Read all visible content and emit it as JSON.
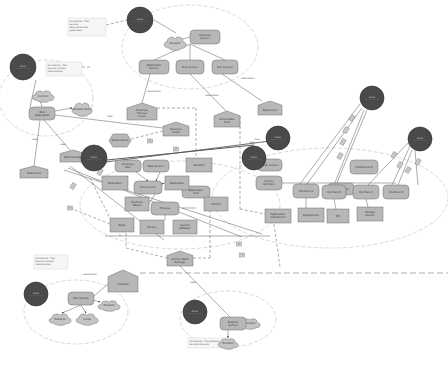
{
  "diagram": {
    "type": "concept-map",
    "colors": {
      "actor": "#4a4a4a",
      "node_fill": "#b7b7b7",
      "node_stroke": "#6f6f6f",
      "cloud_fill": "#c4c4c4",
      "group_ellipse": "#c8c8c8",
      "edge": "#555555",
      "background": "#ffffff"
    },
    "actors": [
      {
        "id": "a1",
        "label": "Actor",
        "x": 140,
        "y": 20,
        "r": 13
      },
      {
        "id": "a2",
        "label": "Actor",
        "x": 23,
        "y": 67,
        "r": 13
      },
      {
        "id": "a3",
        "label": "Actor",
        "x": 94,
        "y": 158,
        "r": 13
      },
      {
        "id": "a4",
        "label": "Actor",
        "x": 278,
        "y": 138,
        "r": 12
      },
      {
        "id": "a5",
        "label": "Actor",
        "x": 254,
        "y": 158,
        "r": 12
      },
      {
        "id": "a6",
        "label": "Actor",
        "x": 372,
        "y": 98,
        "r": 12
      },
      {
        "id": "a7",
        "label": "Actor",
        "x": 420,
        "y": 139,
        "r": 12
      },
      {
        "id": "a8",
        "label": "Actor",
        "x": 36,
        "y": 294,
        "r": 12
      },
      {
        "id": "a9",
        "label": "Actor",
        "x": 195,
        "y": 312,
        "r": 12
      }
    ],
    "groups": [
      {
        "id": "g1",
        "cx": 190,
        "cy": 47,
        "rx": 68,
        "ry": 42
      },
      {
        "id": "g2",
        "cx": 46,
        "cy": 98,
        "rx": 47,
        "ry": 38
      },
      {
        "id": "g3",
        "cx": 180,
        "cy": 205,
        "rx": 100,
        "ry": 44
      },
      {
        "id": "g4",
        "cx": 330,
        "cy": 198,
        "rx": 118,
        "ry": 50
      },
      {
        "id": "g5",
        "cx": 76,
        "cy": 312,
        "rx": 52,
        "ry": 32
      },
      {
        "id": "g6",
        "cx": 228,
        "cy": 319,
        "rx": 48,
        "ry": 28
      }
    ],
    "notes": [
      {
        "id": "n1",
        "x": 68,
        "y": 18,
        "w": 38,
        "h": 18,
        "lines": [
          "Annotation: The",
          "service",
          "description text",
          "goes here..."
        ]
      },
      {
        "id": "n2",
        "x": 46,
        "y": 62,
        "w": 36,
        "h": 14,
        "lines": [
          "Annotation: The",
          "service context",
          "relationships"
        ]
      },
      {
        "id": "n3",
        "x": 34,
        "y": 255,
        "w": 34,
        "h": 14,
        "lines": [
          "Annotation: The",
          "service content",
          "relationships"
        ]
      },
      {
        "id": "n4",
        "x": 188,
        "y": 338,
        "w": 40,
        "h": 10,
        "lines": [
          "Annotation: The software",
          "service lifecycle"
        ]
      }
    ],
    "rounded_nodes": [
      {
        "id": "r1",
        "label": "Business Service",
        "x": 190,
        "y": 30,
        "w": 30,
        "h": 14
      },
      {
        "id": "r2",
        "label": "Application Service",
        "x": 139,
        "y": 60,
        "w": 30,
        "h": 14
      },
      {
        "id": "r3",
        "label": "Tech Service",
        "x": 176,
        "y": 60,
        "w": 28,
        "h": 14
      },
      {
        "id": "r4",
        "label": "Ext. Service",
        "x": 212,
        "y": 60,
        "w": 26,
        "h": 14
      },
      {
        "id": "r5",
        "label": "Web Application",
        "x": 29,
        "y": 107,
        "w": 26,
        "h": 13
      },
      {
        "id": "r6",
        "label": "Business Role",
        "x": 115,
        "y": 160,
        "w": 26,
        "h": 12
      },
      {
        "id": "r7",
        "label": "Data Service",
        "x": 143,
        "y": 160,
        "w": 26,
        "h": 12
      },
      {
        "id": "r8",
        "label": "Core Service",
        "x": 134,
        "y": 181,
        "w": 28,
        "h": 13
      },
      {
        "id": "r9",
        "label": "Process",
        "x": 151,
        "y": 202,
        "w": 28,
        "h": 13
      },
      {
        "id": "r10",
        "label": "Component",
        "x": 328,
        "y": 183,
        "w": 26,
        "h": 12
      },
      {
        "id": "r11",
        "label": "Service Interface",
        "x": 256,
        "y": 176,
        "w": 26,
        "h": 14
      },
      {
        "id": "r12",
        "label": "Interface A",
        "x": 293,
        "y": 184,
        "w": 26,
        "h": 14
      },
      {
        "id": "r13",
        "label": "Interface B",
        "x": 322,
        "y": 185,
        "w": 24,
        "h": 14
      },
      {
        "id": "r14",
        "label": "Interface C",
        "x": 353,
        "y": 185,
        "w": 26,
        "h": 14
      },
      {
        "id": "r15",
        "label": "Interface D",
        "x": 383,
        "y": 185,
        "w": 26,
        "h": 14
      },
      {
        "id": "r16",
        "label": "Node Service",
        "x": 258,
        "y": 159,
        "w": 24,
        "h": 12
      },
      {
        "id": "r17",
        "label": "Component X",
        "x": 350,
        "y": 160,
        "w": 28,
        "h": 14
      },
      {
        "id": "r18",
        "label": "Application Unit",
        "x": 182,
        "y": 186,
        "w": 28,
        "h": 12
      },
      {
        "id": "r19",
        "label": "Ops Service",
        "x": 68,
        "y": 292,
        "w": 26,
        "h": 13
      },
      {
        "id": "r20",
        "label": "Registry Service",
        "x": 220,
        "y": 317,
        "w": 26,
        "h": 13
      }
    ],
    "rect_nodes": [
      {
        "id": "q1",
        "label": "Data Store",
        "x": 102,
        "y": 176,
        "w": 26,
        "h": 14
      },
      {
        "id": "q2",
        "label": "Business Object",
        "x": 125,
        "y": 197,
        "w": 24,
        "h": 14
      },
      {
        "id": "q3",
        "label": "Artifact",
        "x": 204,
        "y": 197,
        "w": 24,
        "h": 14
      },
      {
        "id": "q4",
        "label": "Node",
        "x": 110,
        "y": 218,
        "w": 24,
        "h": 14
      },
      {
        "id": "q5",
        "label": "Device",
        "x": 140,
        "y": 220,
        "w": 24,
        "h": 14
      },
      {
        "id": "q6",
        "label": "System Software",
        "x": 173,
        "y": 220,
        "w": 24,
        "h": 14
      },
      {
        "id": "q7",
        "label": "Network",
        "x": 186,
        "y": 158,
        "w": 26,
        "h": 14
      },
      {
        "id": "q8",
        "label": "Application Component",
        "x": 265,
        "y": 209,
        "w": 26,
        "h": 14
      },
      {
        "id": "q9",
        "label": "Deployment",
        "x": 298,
        "y": 208,
        "w": 26,
        "h": 14
      },
      {
        "id": "q10",
        "label": "DB",
        "x": 327,
        "y": 209,
        "w": 22,
        "h": 14
      },
      {
        "id": "q11",
        "label": "Storage Device",
        "x": 357,
        "y": 207,
        "w": 26,
        "h": 14
      },
      {
        "id": "q12",
        "label": "Application",
        "x": 165,
        "y": 176,
        "w": 24,
        "h": 14
      }
    ],
    "house_nodes": [
      {
        "id": "h1",
        "label": "Business Process Event",
        "x": 127,
        "y": 103,
        "w": 30,
        "h": 17
      },
      {
        "id": "h2",
        "label": "Business Event",
        "x": 163,
        "y": 122,
        "w": 26,
        "h": 14
      },
      {
        "id": "h3",
        "label": "Deliverable Item",
        "x": 214,
        "y": 111,
        "w": 26,
        "h": 16
      },
      {
        "id": "h4",
        "label": "Data Event",
        "x": 258,
        "y": 101,
        "w": 24,
        "h": 14
      },
      {
        "id": "h5",
        "label": "Web Event",
        "x": 20,
        "y": 166,
        "w": 28,
        "h": 12
      },
      {
        "id": "h6",
        "label": "Work Package",
        "x": 60,
        "y": 150,
        "w": 26,
        "h": 12
      },
      {
        "id": "h7",
        "label": "Service Work Package",
        "x": 167,
        "y": 251,
        "w": 26,
        "h": 15
      },
      {
        "id": "h8",
        "label": "Contract",
        "x": 108,
        "y": 270,
        "w": 30,
        "h": 22
      }
    ],
    "hex_nodes": [
      {
        "id": "x1",
        "label": "Requirement",
        "x": 109,
        "y": 134,
        "w": 22,
        "h": 13
      }
    ],
    "clouds": [
      {
        "id": "c1",
        "label": "Network",
        "x": 164,
        "y": 36,
        "w": 22,
        "h": 14
      },
      {
        "id": "c2",
        "label": "Internet",
        "x": 32,
        "y": 90,
        "w": 22,
        "h": 12
      },
      {
        "id": "c3",
        "label": "Network Zone",
        "x": 72,
        "y": 102,
        "w": 20,
        "h": 14
      },
      {
        "id": "c4",
        "label": "Network",
        "x": 49,
        "y": 313,
        "w": 22,
        "h": 12
      },
      {
        "id": "c5",
        "label": "Cloud",
        "x": 76,
        "y": 313,
        "w": 22,
        "h": 12
      },
      {
        "id": "c6",
        "label": "Network",
        "x": 98,
        "y": 300,
        "w": 22,
        "h": 11
      },
      {
        "id": "c7",
        "label": "Network",
        "x": 240,
        "y": 318,
        "w": 20,
        "h": 11
      },
      {
        "id": "c8",
        "label": "Network",
        "x": 218,
        "y": 338,
        "w": 20,
        "h": 11
      }
    ],
    "edge_labels": [
      {
        "text": "association",
        "x": 154,
        "y": 92
      },
      {
        "text": "association",
        "x": 212,
        "y": 96
      },
      {
        "text": "association",
        "x": 248,
        "y": 79
      },
      {
        "text": "flow",
        "x": 110,
        "y": 117
      },
      {
        "text": "uses",
        "x": 35,
        "y": 140
      },
      {
        "text": "uses",
        "x": 63,
        "y": 145
      },
      {
        "text": "flow",
        "x": 252,
        "y": 143
      },
      {
        "text": "flow",
        "x": 257,
        "y": 140
      },
      {
        "text": "association",
        "x": 90,
        "y": 275
      },
      {
        "text": "uses",
        "x": 193,
        "y": 283
      }
    ],
    "small_tags": [
      {
        "label": "T",
        "x": 70,
        "y": 208
      },
      {
        "label": "T",
        "x": 239,
        "y": 244
      },
      {
        "label": "T",
        "x": 242,
        "y": 255
      },
      {
        "label": "T",
        "x": 150,
        "y": 141
      },
      {
        "label": "T",
        "x": 176,
        "y": 149
      }
    ]
  }
}
